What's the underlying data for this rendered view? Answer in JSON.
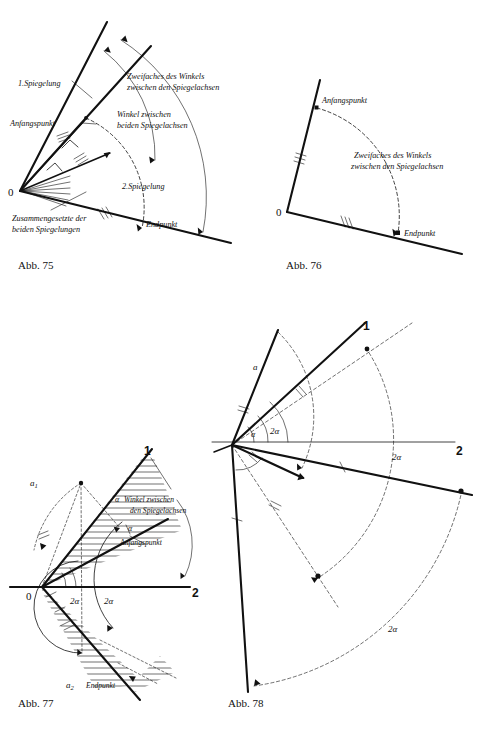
{
  "page": {
    "background": "#ffffff",
    "ink": "#111111",
    "width": 489,
    "height": 734
  },
  "figures": [
    {
      "id": "abb75",
      "caption": "Abb. 75",
      "origin_label": "0",
      "annotations": [
        {
          "name": "first-reflection",
          "text": "1.Spiegelung"
        },
        {
          "name": "start-point",
          "text": "Anfangspunkt"
        },
        {
          "name": "double-angle",
          "line1": "Zweifaches des Winkels",
          "line2": "zwischen den Spiegelachsen"
        },
        {
          "name": "angle-between-axes",
          "line1": "Winkel zwischen",
          "line2": "beiden Spiegelachsen"
        },
        {
          "name": "second-reflection",
          "text": "2.Spiegelung"
        },
        {
          "name": "end-point",
          "text": "Endpunkt"
        },
        {
          "name": "composition",
          "line1": "Zusammengesetzte der",
          "line2": "beiden Spiegelungen"
        }
      ]
    },
    {
      "id": "abb76",
      "caption": "Abb. 76",
      "origin_label": "0",
      "annotations": [
        {
          "name": "start-point",
          "text": "Anfangspunkt"
        },
        {
          "name": "double-angle",
          "line1": "Zweifaches des Winkels",
          "line2": "zwischen den Spiegelachsen"
        },
        {
          "name": "end-point",
          "text": "Endpunkt"
        }
      ]
    },
    {
      "id": "abb77",
      "caption": "Abb. 77",
      "origin_label": "0",
      "axis1_label": "1",
      "axis2_label": "2",
      "annotations": [
        {
          "name": "point-a1",
          "text": "a",
          "sub": "1"
        },
        {
          "name": "point-a2",
          "text": "a",
          "sub": "2"
        },
        {
          "name": "alpha-symbol",
          "text": "α"
        },
        {
          "name": "alpha-legend-symbol",
          "text": "α"
        },
        {
          "name": "angle-between-axes",
          "line1": "Winkel zwischen",
          "line2": "den Spiegelachsen"
        },
        {
          "name": "start-point",
          "text": "Anfangspunkt"
        },
        {
          "name": "end-point",
          "text": "Endpunkt"
        },
        {
          "name": "double-alpha-inner",
          "text": "2α"
        },
        {
          "name": "double-alpha-outer",
          "text": "2α"
        }
      ]
    },
    {
      "id": "abb78",
      "caption": "Abb. 78",
      "axis1_label": "1",
      "axis2_label": "2",
      "annotations": [
        {
          "name": "point-a",
          "text": "a"
        },
        {
          "name": "alpha-symbol",
          "text": "α"
        },
        {
          "name": "double-alpha-near",
          "text": "2α"
        },
        {
          "name": "double-alpha-mid",
          "text": "2α"
        },
        {
          "name": "double-alpha-far",
          "text": "2α"
        }
      ]
    }
  ]
}
